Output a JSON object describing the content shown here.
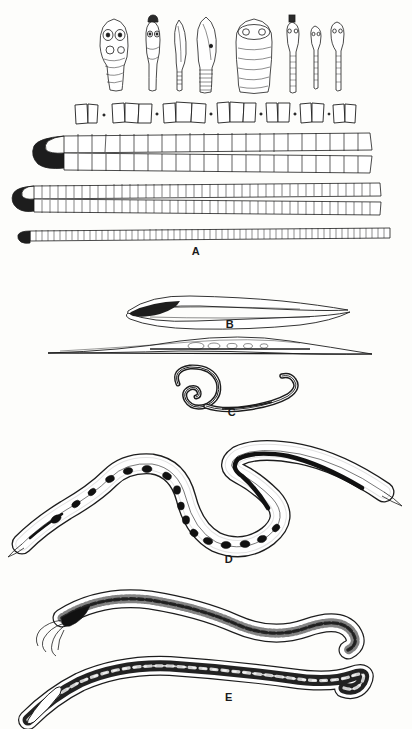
{
  "figure": {
    "kind": "scientific-illustration-plate",
    "background_color": "#fdfdfb",
    "ink_color": "#1d1d1d",
    "width": 412,
    "height": 729
  },
  "panels": [
    {
      "id": "A",
      "label": "A",
      "label_x": 196,
      "label_y": 251,
      "caption_semantic": "cestode scolices, proglottids and strobilae",
      "rows": [
        {
          "name": "scolex-row",
          "semantic": "tapeworm scolices (attachment heads) with suckers",
          "count": 8,
          "y": 14,
          "items": [
            {
              "x": 100,
              "w": 30,
              "h": 58,
              "style": "broad-rounded-4-suckers"
            },
            {
              "x": 142,
              "w": 22,
              "h": 56,
              "style": "narrow-rostellum-2-suckers"
            },
            {
              "x": 172,
              "w": 16,
              "h": 62,
              "style": "lanceolate-blade"
            },
            {
              "x": 196,
              "w": 22,
              "h": 66,
              "style": "lanceolate-striated-neck"
            },
            {
              "x": 234,
              "w": 36,
              "h": 62,
              "style": "broad-barrel-bothria"
            },
            {
              "x": 286,
              "w": 14,
              "h": 66,
              "style": "slender-knobbed-rostellum"
            },
            {
              "x": 310,
              "w": 11,
              "h": 56,
              "style": "slender-small-head"
            },
            {
              "x": 330,
              "w": 13,
              "h": 60,
              "style": "slender-oval-head"
            }
          ]
        },
        {
          "name": "proglottid-row",
          "semantic": "isolated gravid proglottid segments separated by dot marks",
          "y": 100,
          "groups": [
            {
              "x": 74,
              "segments": 2
            },
            {
              "x": 112,
              "segments": 3
            },
            {
              "x": 162,
              "segments": 3
            },
            {
              "x": 216,
              "segments": 3
            },
            {
              "x": 264,
              "segments": 2
            },
            {
              "x": 298,
              "segments": 2
            },
            {
              "x": 330,
              "segments": 2
            }
          ]
        },
        {
          "name": "strobila-rows",
          "semantic": "folded tapeworm bodies (strobilae) of decreasing segment size",
          "chains": [
            {
              "y": 136,
              "seg_w": 13,
              "seg_h": 16,
              "note": "largest segments"
            },
            {
              "y": 164,
              "seg_w": 13,
              "seg_h": 15,
              "note": "largest segments return"
            },
            {
              "y": 190,
              "seg_w": 7,
              "seg_h": 11,
              "note": "medium segments"
            },
            {
              "y": 210,
              "seg_w": 5,
              "seg_h": 9,
              "note": "fine segments"
            },
            {
              "y": 234,
              "seg_w": 3,
              "seg_h": 6,
              "note": "finest segments"
            }
          ]
        }
      ]
    },
    {
      "id": "B",
      "label": "B",
      "label_x": 230,
      "label_y": 318,
      "caption_semantic": "elongate flatworm, lateral view with dark anterior organ",
      "top_y": 292,
      "second_y": 344
    },
    {
      "id": "C",
      "label": "C",
      "label_x": 232,
      "label_y": 408,
      "caption_semantic": "coiled nematode with spiral anterior end",
      "y": 368
    },
    {
      "id": "D",
      "label": "D",
      "label_x": 229,
      "label_y": 558,
      "caption_semantic": "large sinuous nematode showing internal egg masses",
      "y": 452
    },
    {
      "id": "E",
      "label": "E",
      "label_x": 229,
      "label_y": 691,
      "caption_semantic": "pair of nematodes, upper with filamentous anterior, lower with dark gut",
      "upper_y": 590,
      "lower_y": 650
    }
  ]
}
